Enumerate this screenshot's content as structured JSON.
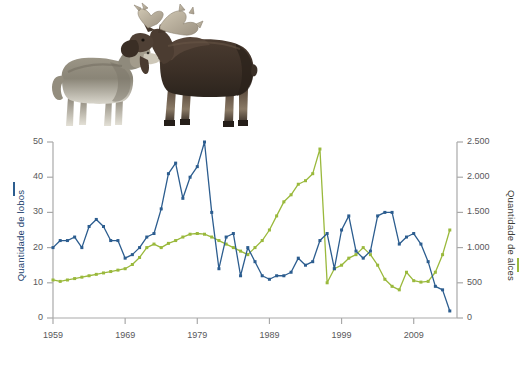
{
  "figure": {
    "background_color": "#ffffff",
    "photos": [
      {
        "name": "wolf-photo",
        "alt": "lobo"
      },
      {
        "name": "moose-photo",
        "alt": "alce"
      }
    ]
  },
  "chart_data": {
    "type": "line",
    "title": "",
    "subtitle": "",
    "xlabel": "",
    "grid": false,
    "legend_position": "axis-titles",
    "x_ticks": [
      "1959",
      "1969",
      "1979",
      "1989",
      "1999",
      "2009"
    ],
    "x_tick_values": [
      1959,
      1969,
      1979,
      1989,
      1999,
      2009
    ],
    "xlim": [
      1959,
      2015
    ],
    "axes": [
      {
        "side": "left",
        "label": "Quantidade de lobos",
        "color": "#2c5d8f",
        "ticks": [
          "0",
          "10",
          "20",
          "30",
          "40",
          "50"
        ],
        "tick_values": [
          0,
          10,
          20,
          30,
          40,
          50
        ],
        "ylim": [
          0,
          50
        ]
      },
      {
        "side": "right",
        "label": "Quantidade de alces",
        "color": "#9ab93c",
        "ticks": [
          "0",
          "500",
          "1.000",
          "1.500",
          "2.000",
          "2.500"
        ],
        "tick_values": [
          0,
          500,
          1000,
          1500,
          2000,
          2500
        ],
        "ylim": [
          0,
          2500
        ]
      }
    ],
    "series": [
      {
        "name": "Quantidade de lobos",
        "axis": "left",
        "color": "#2c5d8f",
        "marker": "square",
        "x": [
          1959,
          1960,
          1961,
          1962,
          1963,
          1964,
          1965,
          1966,
          1967,
          1968,
          1969,
          1970,
          1971,
          1972,
          1973,
          1974,
          1975,
          1976,
          1977,
          1978,
          1979,
          1980,
          1981,
          1982,
          1983,
          1984,
          1985,
          1986,
          1987,
          1988,
          1989,
          1990,
          1991,
          1992,
          1993,
          1994,
          1995,
          1996,
          1997,
          1998,
          1999,
          2000,
          2001,
          2002,
          2003,
          2004,
          2005,
          2006,
          2007,
          2008,
          2009,
          2010,
          2011,
          2012,
          2013,
          2014
        ],
        "values": [
          20,
          22,
          22,
          23,
          20,
          26,
          28,
          26,
          22,
          22,
          17,
          18,
          20,
          23,
          24,
          31,
          41,
          44,
          34,
          40,
          43,
          50,
          30,
          14,
          23,
          24,
          12,
          20,
          16,
          12,
          11,
          12,
          12,
          13,
          17,
          15,
          16,
          22,
          24,
          14,
          25,
          29,
          19,
          17,
          19,
          29,
          30,
          30,
          21,
          23,
          24,
          21,
          16,
          9,
          8,
          2
        ]
      },
      {
        "name": "Quantidade de alces",
        "axis": "right",
        "color": "#9ab93c",
        "marker": "square",
        "x": [
          1959,
          1960,
          1961,
          1962,
          1963,
          1964,
          1965,
          1966,
          1967,
          1968,
          1969,
          1970,
          1971,
          1972,
          1973,
          1974,
          1975,
          1976,
          1977,
          1978,
          1979,
          1980,
          1981,
          1982,
          1983,
          1984,
          1985,
          1986,
          1987,
          1988,
          1989,
          1990,
          1991,
          1992,
          1993,
          1994,
          1995,
          1996,
          1997,
          1998,
          1999,
          2000,
          2001,
          2002,
          2003,
          2004,
          2005,
          2006,
          2007,
          2008,
          2009,
          2010,
          2011,
          2012,
          2013,
          2014
        ],
        "values": [
          540,
          520,
          540,
          560,
          580,
          600,
          620,
          640,
          660,
          680,
          700,
          760,
          860,
          1000,
          1050,
          1000,
          1060,
          1100,
          1150,
          1190,
          1200,
          1190,
          1150,
          1100,
          1050,
          1000,
          950,
          900,
          1000,
          1100,
          1250,
          1450,
          1650,
          1750,
          1900,
          1950,
          2050,
          2400,
          500,
          700,
          750,
          850,
          900,
          1000,
          900,
          750,
          550,
          450,
          400,
          650,
          530,
          510,
          520,
          650,
          900,
          1250
        ]
      }
    ]
  }
}
